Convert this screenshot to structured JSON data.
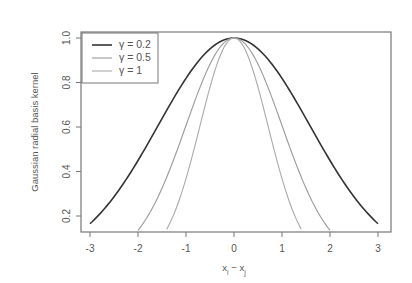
{
  "chart_data": {
    "type": "line",
    "title": "",
    "xlabel": "x_i − x_j",
    "xlabel_main": "x",
    "xlabel_sub_i": "i",
    "xlabel_sub_j": "j",
    "xlabel_minus": " − ",
    "ylabel": "Gaussian radial basis kernel",
    "xlim": [
      -3,
      3
    ],
    "ylim": [
      0.15,
      1.0
    ],
    "x_ticks": [
      -3,
      -2,
      -1,
      0,
      1,
      2,
      3
    ],
    "x_tick_labels": [
      "-3",
      "-2",
      "-1",
      "0",
      "1",
      "2",
      "3"
    ],
    "y_ticks": [
      0.2,
      0.4,
      0.6,
      0.8,
      1.0
    ],
    "y_tick_labels": [
      "0.2",
      "0.4",
      "0.6",
      "0.8",
      "1.0"
    ],
    "grid": false,
    "legend_position": "top-left",
    "formula": "exp(-gamma * x^2)",
    "series": [
      {
        "name": "γ = 0.2",
        "gamma": 0.2,
        "color": "#333333",
        "width": 1.6,
        "x": [
          -3,
          -2,
          -1,
          0,
          1,
          2,
          3
        ],
        "values": [
          0.165,
          0.449,
          0.819,
          1.0,
          0.819,
          0.449,
          0.165
        ]
      },
      {
        "name": "γ = 0.5",
        "gamma": 0.5,
        "color": "#999999",
        "width": 1.1,
        "x": [
          -2,
          -1,
          0,
          1,
          2
        ],
        "values": [
          0.135,
          0.607,
          1.0,
          0.607,
          0.135
        ]
      },
      {
        "name": "γ = 1",
        "gamma": 1,
        "color": "#aaaaaa",
        "width": 1.1,
        "x": [
          -1.4,
          -1,
          0,
          1,
          1.4
        ],
        "values": [
          0.141,
          0.368,
          1.0,
          0.368,
          0.141
        ]
      }
    ],
    "x_range_per_series": [
      [
        -3,
        3
      ],
      [
        -2,
        2
      ],
      [
        -1.4,
        1.4
      ]
    ]
  },
  "legend": {
    "items": [
      {
        "label": "γ = 0.2",
        "color": "#333333"
      },
      {
        "label": "γ = 0.5",
        "color": "#999999"
      },
      {
        "label": "γ = 1",
        "color": "#aaaaaa"
      }
    ]
  },
  "colors": {
    "frame": "#777777",
    "text": "#555555",
    "background": "#ffffff"
  }
}
